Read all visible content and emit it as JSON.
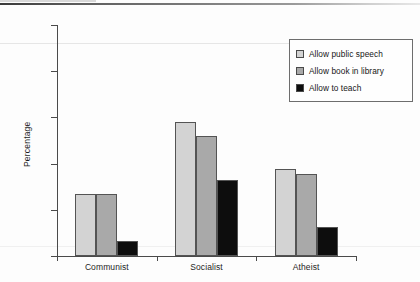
{
  "chart_data": {
    "type": "bar",
    "title": "",
    "xlabel": "",
    "ylabel": "Percentage",
    "ylim": [
      0,
      100
    ],
    "yticks": [
      0,
      20,
      40,
      60,
      80,
      100
    ],
    "grid": false,
    "legend_position": "upper right",
    "categories": [
      "Communist",
      "Socialist",
      "Atheist"
    ],
    "series": [
      {
        "name": "Allow public speech",
        "color": "#d3d3d3",
        "values": [
          27,
          58,
          37.5
        ]
      },
      {
        "name": "Allow book in library",
        "color": "#a9a9a9",
        "values": [
          27,
          52,
          35.5
        ]
      },
      {
        "name": "Allow to teach",
        "color": "#0d0d0d",
        "values": [
          6.5,
          33,
          12.5
        ]
      }
    ]
  },
  "axis": {
    "y_title": "Percentage",
    "y_tick_labels": [
      "0",
      "20",
      "40",
      "60",
      "80",
      "100"
    ],
    "x_tick_labels": [
      "Communist",
      "Socialist",
      "Atheist"
    ]
  },
  "legend": {
    "items": [
      {
        "label": "Allow public speech",
        "color": "#d3d3d3"
      },
      {
        "label": "Allow book in library",
        "color": "#a9a9a9"
      },
      {
        "label": "Allow to teach",
        "color": "#0d0d0d"
      }
    ]
  }
}
